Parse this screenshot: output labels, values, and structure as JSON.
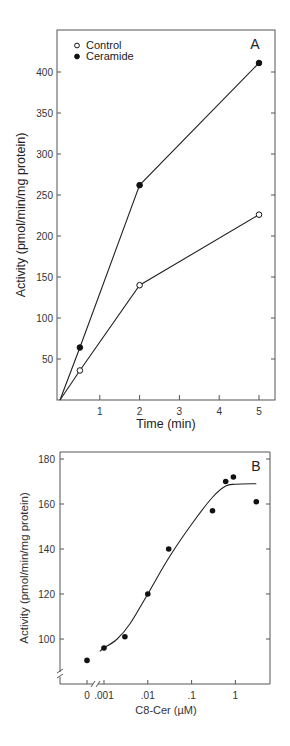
{
  "chart_data": [
    {
      "panel": "A",
      "type": "line",
      "title": "",
      "xlabel": "Time (min)",
      "ylabel": "Activity (pmol/min/mg protein)",
      "xlim": [
        0,
        5.3
      ],
      "ylim": [
        0,
        450
      ],
      "xticks": [
        1,
        2,
        3,
        4,
        5
      ],
      "xtick_labels": [
        "1",
        "2",
        "3",
        "4",
        "5"
      ],
      "yticks": [
        50,
        100,
        150,
        200,
        250,
        300,
        350,
        400
      ],
      "ytick_labels": [
        "50",
        "100",
        "150",
        "200",
        "250",
        "300",
        "350",
        "400"
      ],
      "grid": false,
      "legend": "top-left",
      "series": [
        {
          "name": "Control",
          "marker": "open-circle",
          "x": [
            0,
            0.5,
            2,
            5
          ],
          "y": [
            0,
            36,
            140,
            226
          ]
        },
        {
          "name": "Ceramide",
          "marker": "filled-circle",
          "x": [
            0,
            0.5,
            2,
            5
          ],
          "y": [
            0,
            64,
            262,
            411
          ]
        }
      ]
    },
    {
      "panel": "B",
      "type": "scatter",
      "title": "",
      "xlabel": "C8-Cer (µM)",
      "ylabel": "Activity (pmol/min/mg protein)",
      "xscale": "log (with axis break before 0.001)",
      "xlim": [
        0.0003,
        10
      ],
      "ylim": [
        80,
        182
      ],
      "xticks": [
        0,
        0.001,
        0.01,
        0.1,
        1
      ],
      "xtick_labels": [
        "0",
        ".001",
        ".01",
        ".1",
        "1"
      ],
      "yticks": [
        100,
        120,
        140,
        160,
        180
      ],
      "ytick_labels": [
        "100",
        "120",
        "140",
        "160",
        "180"
      ],
      "grid": false,
      "legend": "none",
      "series": [
        {
          "name": "Ceramide dose",
          "marker": "filled-circle",
          "x": [
            0,
            0.001,
            0.003,
            0.01,
            0.03,
            0.3,
            0.6,
            0.9,
            3
          ],
          "y": [
            90.5,
            96,
            101,
            120,
            140,
            157,
            170,
            172,
            161
          ]
        },
        {
          "name": "Fit curve",
          "marker": "none",
          "style": "smooth-line",
          "x": [
            0.0008,
            0.001,
            0.002,
            0.004,
            0.01,
            0.03,
            0.1,
            0.3,
            0.6,
            1,
            3
          ],
          "y": [
            94.5,
            96,
            100,
            107,
            120,
            136,
            151,
            163,
            168,
            168.8,
            169
          ]
        }
      ]
    }
  ]
}
